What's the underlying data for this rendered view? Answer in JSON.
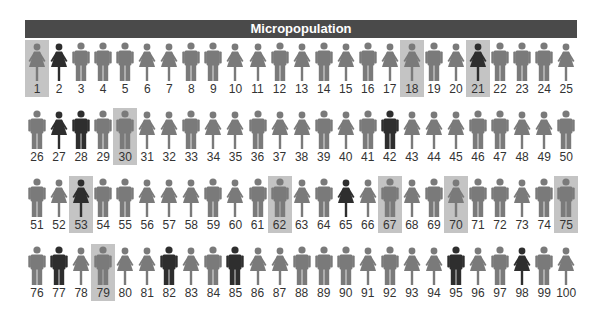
{
  "title": "Micropopulation",
  "colors": {
    "title_bg": "#4a4a4a",
    "figure_normal": "#7a7a7a",
    "figure_dark": "#2e2e2e",
    "highlight_bg": "#c4c4c4"
  },
  "people": [
    {
      "n": "1",
      "g": "F",
      "dark": false,
      "hl": true
    },
    {
      "n": "2",
      "g": "F",
      "dark": true,
      "hl": false
    },
    {
      "n": "3",
      "g": "M",
      "dark": false,
      "hl": false
    },
    {
      "n": "4",
      "g": "M",
      "dark": false,
      "hl": false
    },
    {
      "n": "5",
      "g": "M",
      "dark": false,
      "hl": false
    },
    {
      "n": "6",
      "g": "F",
      "dark": false,
      "hl": false
    },
    {
      "n": "7",
      "g": "F",
      "dark": false,
      "hl": false
    },
    {
      "n": "8",
      "g": "M",
      "dark": false,
      "hl": false
    },
    {
      "n": "9",
      "g": "M",
      "dark": false,
      "hl": false
    },
    {
      "n": "10",
      "g": "F",
      "dark": false,
      "hl": false
    },
    {
      "n": "11",
      "g": "F",
      "dark": false,
      "hl": false
    },
    {
      "n": "12",
      "g": "M",
      "dark": false,
      "hl": false
    },
    {
      "n": "13",
      "g": "F",
      "dark": false,
      "hl": false
    },
    {
      "n": "14",
      "g": "M",
      "dark": false,
      "hl": false
    },
    {
      "n": "15",
      "g": "F",
      "dark": false,
      "hl": false
    },
    {
      "n": "16",
      "g": "M",
      "dark": false,
      "hl": false
    },
    {
      "n": "17",
      "g": "F",
      "dark": false,
      "hl": false
    },
    {
      "n": "18",
      "g": "F",
      "dark": false,
      "hl": true
    },
    {
      "n": "19",
      "g": "M",
      "dark": false,
      "hl": false
    },
    {
      "n": "20",
      "g": "F",
      "dark": false,
      "hl": false
    },
    {
      "n": "21",
      "g": "F",
      "dark": true,
      "hl": true
    },
    {
      "n": "22",
      "g": "M",
      "dark": false,
      "hl": false
    },
    {
      "n": "23",
      "g": "M",
      "dark": false,
      "hl": false
    },
    {
      "n": "24",
      "g": "M",
      "dark": false,
      "hl": false
    },
    {
      "n": "25",
      "g": "F",
      "dark": false,
      "hl": false
    },
    {
      "n": "26",
      "g": "M",
      "dark": false,
      "hl": false
    },
    {
      "n": "27",
      "g": "F",
      "dark": true,
      "hl": false
    },
    {
      "n": "28",
      "g": "M",
      "dark": true,
      "hl": false
    },
    {
      "n": "29",
      "g": "M",
      "dark": false,
      "hl": false
    },
    {
      "n": "30",
      "g": "M",
      "dark": false,
      "hl": true
    },
    {
      "n": "31",
      "g": "F",
      "dark": false,
      "hl": false
    },
    {
      "n": "32",
      "g": "F",
      "dark": false,
      "hl": false
    },
    {
      "n": "33",
      "g": "M",
      "dark": false,
      "hl": false
    },
    {
      "n": "34",
      "g": "F",
      "dark": false,
      "hl": false
    },
    {
      "n": "35",
      "g": "F",
      "dark": false,
      "hl": false
    },
    {
      "n": "36",
      "g": "M",
      "dark": false,
      "hl": false
    },
    {
      "n": "37",
      "g": "F",
      "dark": false,
      "hl": false
    },
    {
      "n": "38",
      "g": "F",
      "dark": false,
      "hl": false
    },
    {
      "n": "39",
      "g": "M",
      "dark": false,
      "hl": false
    },
    {
      "n": "40",
      "g": "F",
      "dark": false,
      "hl": false
    },
    {
      "n": "41",
      "g": "M",
      "dark": false,
      "hl": false
    },
    {
      "n": "42",
      "g": "M",
      "dark": true,
      "hl": false
    },
    {
      "n": "43",
      "g": "F",
      "dark": false,
      "hl": false
    },
    {
      "n": "44",
      "g": "F",
      "dark": false,
      "hl": false
    },
    {
      "n": "45",
      "g": "F",
      "dark": false,
      "hl": false
    },
    {
      "n": "46",
      "g": "M",
      "dark": false,
      "hl": false
    },
    {
      "n": "47",
      "g": "M",
      "dark": false,
      "hl": false
    },
    {
      "n": "48",
      "g": "F",
      "dark": false,
      "hl": false
    },
    {
      "n": "49",
      "g": "F",
      "dark": false,
      "hl": false
    },
    {
      "n": "50",
      "g": "M",
      "dark": false,
      "hl": false
    },
    {
      "n": "51",
      "g": "M",
      "dark": false,
      "hl": false
    },
    {
      "n": "52",
      "g": "F",
      "dark": false,
      "hl": false
    },
    {
      "n": "53",
      "g": "F",
      "dark": true,
      "hl": true
    },
    {
      "n": "54",
      "g": "M",
      "dark": false,
      "hl": false
    },
    {
      "n": "55",
      "g": "M",
      "dark": false,
      "hl": false
    },
    {
      "n": "56",
      "g": "F",
      "dark": false,
      "hl": false
    },
    {
      "n": "57",
      "g": "F",
      "dark": false,
      "hl": false
    },
    {
      "n": "58",
      "g": "F",
      "dark": false,
      "hl": false
    },
    {
      "n": "59",
      "g": "M",
      "dark": false,
      "hl": false
    },
    {
      "n": "60",
      "g": "F",
      "dark": false,
      "hl": false
    },
    {
      "n": "61",
      "g": "M",
      "dark": false,
      "hl": false
    },
    {
      "n": "62",
      "g": "M",
      "dark": false,
      "hl": true
    },
    {
      "n": "63",
      "g": "F",
      "dark": false,
      "hl": false
    },
    {
      "n": "64",
      "g": "M",
      "dark": false,
      "hl": false
    },
    {
      "n": "65",
      "g": "F",
      "dark": true,
      "hl": false
    },
    {
      "n": "66",
      "g": "F",
      "dark": false,
      "hl": false
    },
    {
      "n": "67",
      "g": "M",
      "dark": false,
      "hl": true
    },
    {
      "n": "68",
      "g": "F",
      "dark": false,
      "hl": false
    },
    {
      "n": "69",
      "g": "M",
      "dark": false,
      "hl": false
    },
    {
      "n": "70",
      "g": "F",
      "dark": false,
      "hl": true
    },
    {
      "n": "71",
      "g": "M",
      "dark": false,
      "hl": false
    },
    {
      "n": "72",
      "g": "M",
      "dark": false,
      "hl": false
    },
    {
      "n": "73",
      "g": "F",
      "dark": false,
      "hl": false
    },
    {
      "n": "74",
      "g": "M",
      "dark": false,
      "hl": false
    },
    {
      "n": "75",
      "g": "M",
      "dark": false,
      "hl": true
    },
    {
      "n": "76",
      "g": "M",
      "dark": false,
      "hl": false
    },
    {
      "n": "77",
      "g": "M",
      "dark": true,
      "hl": false
    },
    {
      "n": "78",
      "g": "F",
      "dark": false,
      "hl": false
    },
    {
      "n": "79",
      "g": "M",
      "dark": false,
      "hl": true
    },
    {
      "n": "80",
      "g": "F",
      "dark": false,
      "hl": false
    },
    {
      "n": "81",
      "g": "F",
      "dark": false,
      "hl": false
    },
    {
      "n": "82",
      "g": "M",
      "dark": true,
      "hl": false
    },
    {
      "n": "83",
      "g": "F",
      "dark": false,
      "hl": false
    },
    {
      "n": "84",
      "g": "M",
      "dark": false,
      "hl": false
    },
    {
      "n": "85",
      "g": "M",
      "dark": true,
      "hl": false
    },
    {
      "n": "86",
      "g": "F",
      "dark": false,
      "hl": false
    },
    {
      "n": "87",
      "g": "F",
      "dark": false,
      "hl": false
    },
    {
      "n": "88",
      "g": "M",
      "dark": false,
      "hl": false
    },
    {
      "n": "89",
      "g": "M",
      "dark": false,
      "hl": false
    },
    {
      "n": "90",
      "g": "M",
      "dark": false,
      "hl": false
    },
    {
      "n": "91",
      "g": "F",
      "dark": false,
      "hl": false
    },
    {
      "n": "92",
      "g": "M",
      "dark": false,
      "hl": false
    },
    {
      "n": "93",
      "g": "F",
      "dark": false,
      "hl": false
    },
    {
      "n": "94",
      "g": "F",
      "dark": false,
      "hl": false
    },
    {
      "n": "95",
      "g": "M",
      "dark": true,
      "hl": false
    },
    {
      "n": "96",
      "g": "F",
      "dark": false,
      "hl": false
    },
    {
      "n": "97",
      "g": "M",
      "dark": false,
      "hl": false
    },
    {
      "n": "98",
      "g": "F",
      "dark": true,
      "hl": false
    },
    {
      "n": "99",
      "g": "M",
      "dark": false,
      "hl": false
    },
    {
      "n": "100",
      "g": "F",
      "dark": false,
      "hl": false
    }
  ]
}
